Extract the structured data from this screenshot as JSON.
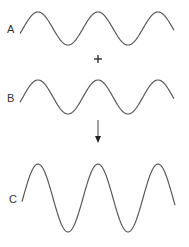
{
  "diagram": {
    "colors": {
      "stroke": "#5a5a5a",
      "text": "#333333",
      "background": "#ffffff"
    },
    "operator": "+",
    "result_arrow": "down-arrow",
    "waves": [
      {
        "label": "A",
        "x_start": 20,
        "x_end": 174,
        "center_y": 28.5,
        "amplitude": 16.5,
        "period": 60,
        "phase_peak_x": 38
      },
      {
        "label": "B",
        "x_start": 20,
        "x_end": 174,
        "center_y": 97,
        "amplitude": 17,
        "period": 60,
        "phase_peak_x": 38
      },
      {
        "label": "C",
        "x_start": 22,
        "x_end": 175,
        "center_y": 198,
        "amplitude": 34,
        "period": 60,
        "phase_peak_x": 38
      }
    ]
  }
}
